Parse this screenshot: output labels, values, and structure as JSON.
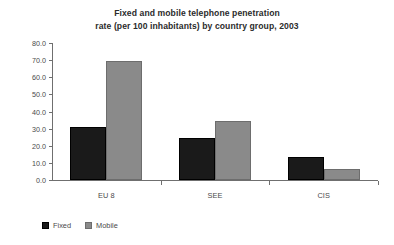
{
  "chart_data": {
    "type": "bar",
    "title": "Fixed and mobile telephone penetration rate (per 100 inhabitants) by country group, 2003",
    "title_lines": [
      "Fixed and mobile telephone penetration",
      "rate (per 100 inhabitants) by country group, 2003"
    ],
    "categories": [
      "EU 8",
      "SEE",
      "CIS"
    ],
    "series": [
      {
        "name": "Fixed",
        "color": "#1a1a1a",
        "values": [
          31.0,
          24.5,
          13.5
        ]
      },
      {
        "name": "Mobile",
        "color": "#8a8a8a",
        "values": [
          69.5,
          34.5,
          6.5
        ]
      }
    ],
    "xlabel": "",
    "ylabel": "",
    "ylim": [
      0.0,
      80.0
    ],
    "ytick_values": [
      0.0,
      10.0,
      20.0,
      30.0,
      40.0,
      50.0,
      60.0,
      70.0,
      80.0
    ],
    "ytick_labels": [
      "0.0",
      "10.0",
      "20.0",
      "30.0",
      "40.0",
      "50.0",
      "60.0",
      "70.0",
      "80.0"
    ],
    "grid": false,
    "legend_position": "bottom-left",
    "legend_entries": [
      "Fixed",
      "Mobile"
    ]
  }
}
